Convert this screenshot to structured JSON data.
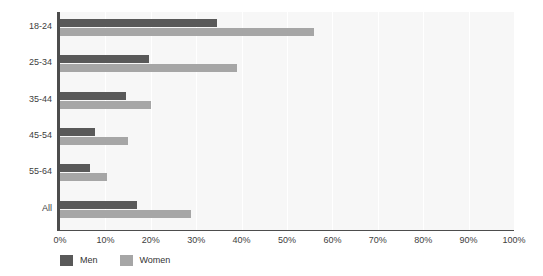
{
  "chart_data": {
    "type": "bar",
    "orientation": "horizontal",
    "title": "",
    "xlabel": "",
    "ylabel": "",
    "categories": [
      "18-24",
      "25-34",
      "35-44",
      "45-54",
      "55-64",
      "All"
    ],
    "series": [
      {
        "name": "Men",
        "color": "#595959",
        "values": [
          34.5,
          19.5,
          14.5,
          7.7,
          6.5,
          17.0
        ]
      },
      {
        "name": "Women",
        "color": "#a6a6a6",
        "values": [
          56.0,
          39.0,
          20.0,
          15.0,
          10.3,
          28.8
        ]
      }
    ],
    "xlim": [
      0,
      100
    ],
    "xticks": [
      0,
      10,
      20,
      30,
      40,
      50,
      60,
      70,
      80,
      90,
      100
    ],
    "xtick_labels": [
      "0%",
      "10%",
      "20%",
      "30%",
      "40%",
      "50%",
      "60%",
      "70%",
      "80%",
      "90%",
      "100%"
    ],
    "grid": true,
    "grid_axis": "x",
    "legend_position": "bottom-left",
    "plot_background": "#f7f7f7",
    "axis_color": "#4d4d4d"
  },
  "legend": {
    "items": [
      {
        "label": "Men",
        "color": "#595959"
      },
      {
        "label": "Women",
        "color": "#a6a6a6"
      }
    ]
  }
}
